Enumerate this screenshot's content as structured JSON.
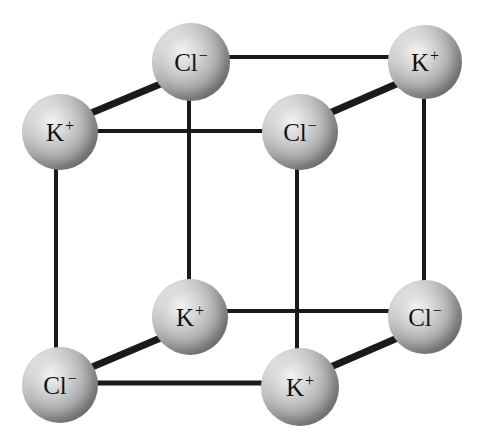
{
  "figure": {
    "background_color": "#ffffff",
    "width": 484,
    "height": 436,
    "label_color": "#121212",
    "bond_color": "#1a1a1a",
    "sphere_light_color": "#f2f2f2",
    "sphere_dark_color": "#6d6d6d"
  },
  "ions": [
    {
      "id": "cl-top-back",
      "species": "Cl",
      "charge": "−",
      "label": "Cl",
      "position": "top-back-left",
      "cx": 191,
      "cy": 62,
      "r": 39
    },
    {
      "id": "k-top-back-right",
      "species": "K",
      "charge": "+",
      "label": "K",
      "position": "top-back-right",
      "cx": 425,
      "cy": 62,
      "r": 37
    },
    {
      "id": "k-top-front-left",
      "species": "K",
      "charge": "+",
      "label": "K",
      "position": "top-front-left",
      "cx": 60,
      "cy": 132,
      "r": 38
    },
    {
      "id": "cl-top-front-right",
      "species": "Cl",
      "charge": "−",
      "label": "Cl",
      "position": "top-front-right",
      "cx": 300,
      "cy": 132,
      "r": 38
    },
    {
      "id": "k-bottom-back-left",
      "species": "K",
      "charge": "+",
      "label": "K",
      "position": "bottom-back-left",
      "cx": 190,
      "cy": 317,
      "r": 38
    },
    {
      "id": "cl-bottom-back-right",
      "species": "Cl",
      "charge": "−",
      "label": "Cl",
      "position": "bottom-back-right",
      "cx": 425,
      "cy": 317,
      "r": 37
    },
    {
      "id": "cl-bottom-front-left",
      "species": "Cl",
      "charge": "−",
      "label": "Cl",
      "position": "bottom-front-left",
      "cx": 60,
      "cy": 385,
      "r": 38
    },
    {
      "id": "k-bottom-front-right",
      "species": "K",
      "charge": "+",
      "label": "K",
      "position": "bottom-front-right",
      "cx": 300,
      "cy": 387,
      "r": 39
    }
  ],
  "bonds": [
    {
      "id": "bond-top-back-horizontal",
      "from": "cl-top-back",
      "to": "k-top-back-right",
      "x1": 222,
      "y1": 57,
      "x2": 392,
      "y2": 57,
      "width": 4
    },
    {
      "id": "bond-top-left-diagonal",
      "from": "k-top-front-left",
      "to": "cl-top-back",
      "x1": 84,
      "y1": 116,
      "x2": 170,
      "y2": 80,
      "width": 7
    },
    {
      "id": "bond-top-right-diagonal",
      "from": "cl-top-front-right",
      "to": "k-top-back-right",
      "x1": 325,
      "y1": 115,
      "x2": 408,
      "y2": 79,
      "width": 7
    },
    {
      "id": "bond-top-front-horizontal",
      "from": "k-top-front-left",
      "to": "cl-top-front-right",
      "x1": 90,
      "y1": 131,
      "x2": 268,
      "y2": 131,
      "width": 4
    },
    {
      "id": "bond-left-vertical",
      "from": "k-top-front-left",
      "to": "cl-bottom-front-left",
      "x1": 56,
      "y1": 168,
      "x2": 56,
      "y2": 350,
      "width": 4
    },
    {
      "id": "bond-back-left-vertical",
      "from": "cl-top-back",
      "to": "k-bottom-back-left",
      "x1": 189,
      "y1": 100,
      "x2": 189,
      "y2": 282,
      "width": 4
    },
    {
      "id": "bond-middle-vertical",
      "from": "cl-top-front-right",
      "to": "k-bottom-front-right",
      "x1": 297,
      "y1": 169,
      "x2": 297,
      "y2": 351,
      "width": 4
    },
    {
      "id": "bond-right-vertical",
      "from": "k-top-back-right",
      "to": "cl-bottom-back-right",
      "x1": 424,
      "y1": 99,
      "x2": 424,
      "y2": 281,
      "width": 4
    },
    {
      "id": "bond-bottom-back-horizontal",
      "from": "k-bottom-back-left",
      "to": "cl-bottom-back-right",
      "x1": 222,
      "y1": 311,
      "x2": 392,
      "y2": 311,
      "width": 4
    },
    {
      "id": "bond-bottom-left-diagonal",
      "from": "cl-bottom-front-left",
      "to": "k-bottom-back-left",
      "x1": 85,
      "y1": 370,
      "x2": 170,
      "y2": 334,
      "width": 7
    },
    {
      "id": "bond-bottom-right-diagonal",
      "from": "k-bottom-front-right",
      "to": "cl-bottom-back-right",
      "x1": 326,
      "y1": 369,
      "x2": 409,
      "y2": 333,
      "width": 7
    },
    {
      "id": "bond-bottom-front-horizontal",
      "from": "cl-bottom-front-left",
      "to": "k-bottom-front-right",
      "x1": 90,
      "y1": 383,
      "x2": 268,
      "y2": 383,
      "width": 5
    }
  ]
}
